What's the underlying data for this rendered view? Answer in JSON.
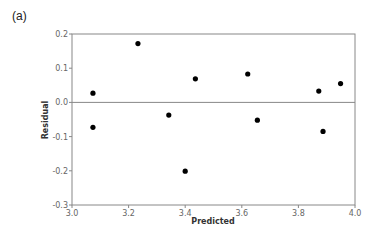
{
  "panel_label": "(a)",
  "chart_data": {
    "type": "scatter",
    "title": "",
    "xlabel": "Predicted",
    "ylabel": "Residual",
    "xlim": [
      3.0,
      4.0
    ],
    "ylim": [
      -0.3,
      0.2
    ],
    "xticks": [
      "3.0",
      "3.2",
      "3.4",
      "3.6",
      "3.8",
      "4.0"
    ],
    "yticks": [
      "0.2",
      "0.1",
      "0.0",
      "-0.1",
      "-0.2",
      "-0.3"
    ],
    "reference_line": {
      "y": 0.0
    },
    "grid": false,
    "legend": null,
    "points": [
      {
        "x": 3.074,
        "y": 0.027
      },
      {
        "x": 3.074,
        "y": -0.073
      },
      {
        "x": 3.233,
        "y": 0.172
      },
      {
        "x": 3.342,
        "y": -0.037
      },
      {
        "x": 3.4,
        "y": -0.201
      },
      {
        "x": 3.436,
        "y": 0.069
      },
      {
        "x": 3.621,
        "y": 0.083
      },
      {
        "x": 3.655,
        "y": -0.052
      },
      {
        "x": 3.872,
        "y": 0.033
      },
      {
        "x": 3.887,
        "y": -0.085
      },
      {
        "x": 3.949,
        "y": 0.055
      }
    ]
  },
  "colors": {
    "axis": "#888888",
    "point": "#000000",
    "reference_line": "#888888"
  }
}
